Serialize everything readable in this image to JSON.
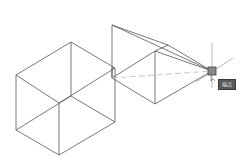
{
  "viewport": {
    "background": "#ffffff",
    "line_color": "#555555",
    "tracking_line_color": "#bbbbbb"
  },
  "snap": {
    "type": "endpoint",
    "tooltip_label": "端点",
    "marker_color": "#555555",
    "position": [
      212,
      71
    ]
  },
  "shapes": {
    "left_box": {
      "edges": [
        [
          [
            71,
            42
          ],
          [
            16,
            75
          ]
        ],
        [
          [
            71,
            42
          ],
          [
            115,
            68
          ]
        ],
        [
          [
            16,
            75
          ],
          [
            59,
            103
          ]
        ],
        [
          [
            115,
            68
          ],
          [
            59,
            103
          ]
        ],
        [
          [
            16,
            75
          ],
          [
            16,
            130
          ]
        ],
        [
          [
            59,
            103
          ],
          [
            59,
            155
          ]
        ],
        [
          [
            115,
            68
          ],
          [
            115,
            122
          ]
        ],
        [
          [
            16,
            130
          ],
          [
            59,
            155
          ]
        ],
        [
          [
            59,
            155
          ],
          [
            115,
            122
          ]
        ],
        [
          [
            71,
            42
          ],
          [
            71,
            96
          ]
        ],
        [
          [
            71,
            96
          ],
          [
            16,
            130
          ]
        ],
        [
          [
            71,
            96
          ],
          [
            115,
            122
          ]
        ]
      ]
    },
    "right_box": {
      "edges": [
        [
          [
            112,
            25
          ],
          [
            112,
            78
          ]
        ],
        [
          [
            112,
            25
          ],
          [
            168,
            45
          ]
        ],
        [
          [
            112,
            25
          ],
          [
            212,
            71
          ]
        ],
        [
          [
            168,
            45
          ],
          [
            155,
            51
          ]
        ],
        [
          [
            168,
            45
          ],
          [
            212,
            71
          ]
        ],
        [
          [
            155,
            51
          ],
          [
            112,
            78
          ]
        ],
        [
          [
            155,
            51
          ],
          [
            155,
            104
          ]
        ],
        [
          [
            155,
            51
          ],
          [
            212,
            71
          ]
        ],
        [
          [
            155,
            104
          ],
          [
            212,
            71
          ]
        ],
        [
          [
            112,
            78
          ],
          [
            155,
            104
          ]
        ],
        [
          [
            112,
            68
          ],
          [
            115,
            68
          ]
        ],
        [
          [
            112,
            68
          ],
          [
            112,
            78
          ]
        ]
      ],
      "tracking_line": [
        [
          112,
          78
        ],
        [
          212,
          71
        ]
      ]
    }
  }
}
